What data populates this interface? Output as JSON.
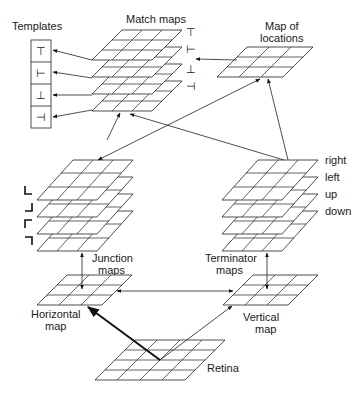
{
  "diagram": {
    "type": "neural-network-architecture",
    "labels": {
      "templates": "Templates",
      "match_maps": "Match maps",
      "map_of_locations_line1": "Map of",
      "map_of_locations_line2": "locations",
      "junction_maps_line1": "Junction",
      "junction_maps_line2": "maps",
      "terminator_maps_line1": "Terminator",
      "terminator_maps_line2": "maps",
      "horizontal_map_line1": "Horizontal",
      "horizontal_map_line2": "map",
      "vertical_map_line1": "Vertical",
      "vertical_map_line2": "map",
      "retina": "Retina"
    },
    "templates": {
      "glyphs": [
        "⊤",
        "⊢",
        "⊥",
        "⊣"
      ]
    },
    "match_map_glyphs": [
      "⊤",
      "⊢",
      "⊥",
      "⊣"
    ],
    "junction_glyphs": [
      "L",
      "⅃",
      "Γ",
      "ꓶ"
    ],
    "terminator_directions": [
      "right",
      "left",
      "up",
      "down"
    ],
    "nodes": [
      {
        "id": "retina",
        "label": "Retina",
        "grid": "4x4"
      },
      {
        "id": "horizontal_map",
        "label": "Horizontal map",
        "grid": "3x3"
      },
      {
        "id": "vertical_map",
        "label": "Vertical map",
        "grid": "3x3"
      },
      {
        "id": "junction_maps",
        "label": "Junction maps",
        "layers": 4
      },
      {
        "id": "terminator_maps",
        "label": "Terminator maps",
        "layers": 4
      },
      {
        "id": "match_maps",
        "label": "Match maps",
        "layers": 4
      },
      {
        "id": "map_of_locations",
        "label": "Map of locations",
        "grid": "3x3"
      },
      {
        "id": "templates",
        "label": "Templates",
        "slots": 4
      }
    ],
    "edges": [
      {
        "from": "retina",
        "to": "horizontal_map",
        "style": "thick"
      },
      {
        "from": "retina",
        "to": "vertical_map"
      },
      {
        "from": "horizontal_map",
        "to": "vertical_map",
        "bidirectional": true
      },
      {
        "from": "junction_maps",
        "to": "horizontal_map",
        "bidirectional": true
      },
      {
        "from": "terminator_maps",
        "to": "vertical_map",
        "bidirectional": true
      },
      {
        "from": "junction_maps",
        "to": "map_of_locations",
        "bidirectional": true
      },
      {
        "from": "terminator_maps",
        "to": "match_maps"
      },
      {
        "from": "terminator_maps",
        "to": "map_of_locations"
      },
      {
        "from": "junction_maps",
        "to": "match_maps"
      },
      {
        "from": "map_of_locations",
        "to": "match_maps"
      },
      {
        "from": "match_maps",
        "to": "templates",
        "count": 4
      }
    ]
  }
}
